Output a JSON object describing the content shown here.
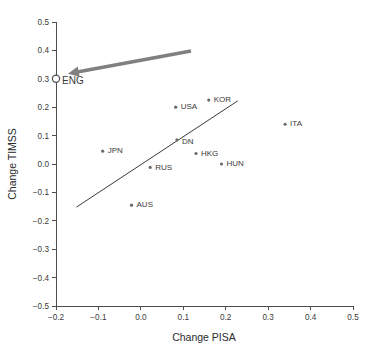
{
  "chart_data": {
    "type": "scatter",
    "title": "",
    "xlabel": "Change PISA",
    "ylabel": "Change TIMSS",
    "xlim": [
      -0.2,
      0.5
    ],
    "ylim": [
      -0.5,
      0.5
    ],
    "xticks": [
      "-0.2",
      "-0.1",
      "0.0",
      "0.1",
      "0.2",
      "0.3",
      "0.4",
      "0.5"
    ],
    "xtick_values": [
      -0.2,
      -0.1,
      0.0,
      0.1,
      0.2,
      0.3,
      0.4,
      0.5
    ],
    "yticks": [
      "0.5",
      "0.4",
      "0.3",
      "0.2",
      "0.1",
      "0.0",
      "-0.1",
      "-0.2",
      "-0.3",
      "-0.4",
      "-0.5"
    ],
    "ytick_values": [
      0.5,
      0.4,
      0.3,
      0.2,
      0.1,
      0.0,
      -0.1,
      -0.2,
      -0.3,
      -0.4,
      -0.5
    ],
    "grid": false,
    "legend": "none",
    "marker_color": "#6b6b6b",
    "highlight_color": "#808080",
    "points": [
      {
        "label": "ENG",
        "x": -0.2,
        "y": 0.3,
        "style": "open",
        "highlight": true,
        "label_dx": 6,
        "label_dy": 3
      },
      {
        "label": "JPN",
        "x": -0.09,
        "y": 0.045,
        "style": "filled",
        "highlight": false,
        "label_dx": 5,
        "label_dy": 0
      },
      {
        "label": "AUS",
        "x": -0.022,
        "y": -0.145,
        "style": "filled",
        "highlight": false,
        "label_dx": 5,
        "label_dy": 0
      },
      {
        "label": "RUS",
        "x": 0.022,
        "y": -0.012,
        "style": "filled",
        "highlight": false,
        "label_dx": 5,
        "label_dy": 0
      },
      {
        "label": "USA",
        "x": 0.082,
        "y": 0.2,
        "style": "filled",
        "highlight": false,
        "label_dx": 5,
        "label_dy": 0
      },
      {
        "label": "DN",
        "x": 0.085,
        "y": 0.085,
        "style": "filled",
        "highlight": false,
        "label_dx": 5,
        "label_dy": 2
      },
      {
        "label": "HKG",
        "x": 0.13,
        "y": 0.037,
        "style": "filled",
        "highlight": false,
        "label_dx": 5,
        "label_dy": 0
      },
      {
        "label": "KOR",
        "x": 0.16,
        "y": 0.225,
        "style": "filled",
        "highlight": false,
        "label_dx": 5,
        "label_dy": 0
      },
      {
        "label": "HUN",
        "x": 0.19,
        "y": 0.0,
        "style": "filled",
        "highlight": false,
        "label_dx": 5,
        "label_dy": 0
      },
      {
        "label": "ITA",
        "x": 0.34,
        "y": 0.14,
        "style": "filled",
        "highlight": false,
        "label_dx": 5,
        "label_dy": 0
      }
    ],
    "trend_line": {
      "x_start": -0.152,
      "y_start": -0.152,
      "x_end": 0.228,
      "y_end": 0.222
    },
    "annotation": {
      "kind": "arrow",
      "target_label": "ENG",
      "tail_x": 0.118,
      "tail_y": 0.398,
      "head_x": -0.172,
      "head_y": 0.318
    }
  }
}
